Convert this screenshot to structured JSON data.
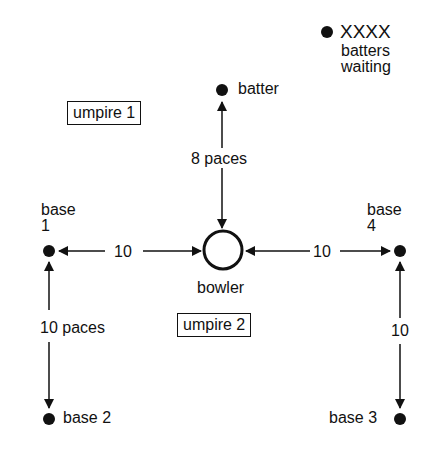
{
  "diagram": {
    "waiting": {
      "marker": "XXXX",
      "label_line1": "batters",
      "label_line2": "waiting"
    },
    "batter": {
      "label": "batter"
    },
    "umpire1": {
      "label": "umpire 1"
    },
    "umpire2": {
      "label": "umpire 2"
    },
    "bowler": {
      "label": "bowler"
    },
    "base1": {
      "label_line1": "base",
      "label_line2": "1"
    },
    "base4": {
      "label_line1": "base",
      "label_line2": "4"
    },
    "base2": {
      "label": "base 2"
    },
    "base3": {
      "label": "base 3"
    },
    "distances": {
      "bowler_to_batter": "8 paces",
      "base1_to_bowler": "10",
      "bowler_to_base4": "10",
      "base1_to_base2": "10 paces",
      "base4_to_base3": "10"
    },
    "colors": {
      "ink": "#111111",
      "background": "#ffffff"
    }
  }
}
